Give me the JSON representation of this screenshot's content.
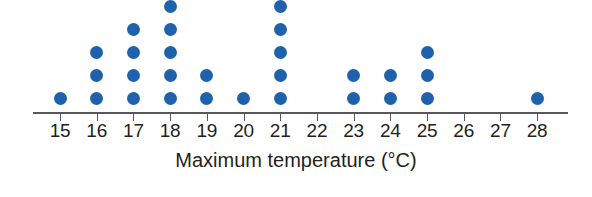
{
  "chart_data": {
    "type": "dot-plot",
    "title": "",
    "xlabel": "Maximum temperature (°C)",
    "ylabel": "",
    "categories": [
      15,
      16,
      17,
      18,
      19,
      20,
      21,
      22,
      23,
      24,
      25,
      26,
      27,
      28
    ],
    "tick_labels": [
      "15",
      "16",
      "17",
      "18",
      "19",
      "20",
      "21",
      "22",
      "23",
      "24",
      "25",
      "26",
      "27",
      "28"
    ],
    "values": [
      1,
      3,
      4,
      5,
      2,
      1,
      5,
      0,
      2,
      2,
      3,
      0,
      0,
      1
    ],
    "xlim": [
      14.5,
      28.8
    ],
    "ylim": [
      0,
      5
    ],
    "grid": false,
    "legend": "none",
    "dot_color": "#1f62ab",
    "axis_color": "#58585a",
    "text_color": "#231f20",
    "background_color": "#ffffff",
    "total_count": 29
  },
  "layout": {
    "axis_left_px": 33,
    "axis_right_px": 568,
    "axis_y_px": 112,
    "first_tick_x_px": 60,
    "tick_spacing_px": 36.7,
    "dot_baseline_y_px": 98,
    "dot_spacing_y_px": 23,
    "dot_diameter_px": 13
  }
}
